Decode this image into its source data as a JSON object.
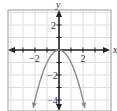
{
  "chart_data": {
    "type": "line",
    "title": "",
    "function": "y = -x^2",
    "xlabel": "x",
    "ylabel": "y",
    "xlim": [
      -4.25,
      4.3
    ],
    "ylim": [
      -4.8,
      3.2
    ],
    "grid": true,
    "grid_step": 1,
    "x_ticks": [
      -2,
      2
    ],
    "y_ticks": [
      2,
      -2,
      -4
    ],
    "x_tick_labels": [
      "−2",
      "2"
    ],
    "y_tick_labels": [
      "2",
      "−2",
      "−4"
    ],
    "series": [
      {
        "name": "y = -x^2",
        "x": [
          -2.15,
          -2,
          -1.5,
          -1,
          -0.5,
          0,
          0.5,
          1,
          1.5,
          2,
          2.15
        ],
        "y": [
          -4.62,
          -4,
          -2.25,
          -1,
          -0.25,
          0,
          -0.25,
          -1,
          -2.25,
          -4,
          -4.62
        ]
      }
    ],
    "colors": {
      "curve": "#8a8a8a",
      "axes": "#222222",
      "grid": "#dddddd",
      "border": "#9a9a9a"
    }
  }
}
